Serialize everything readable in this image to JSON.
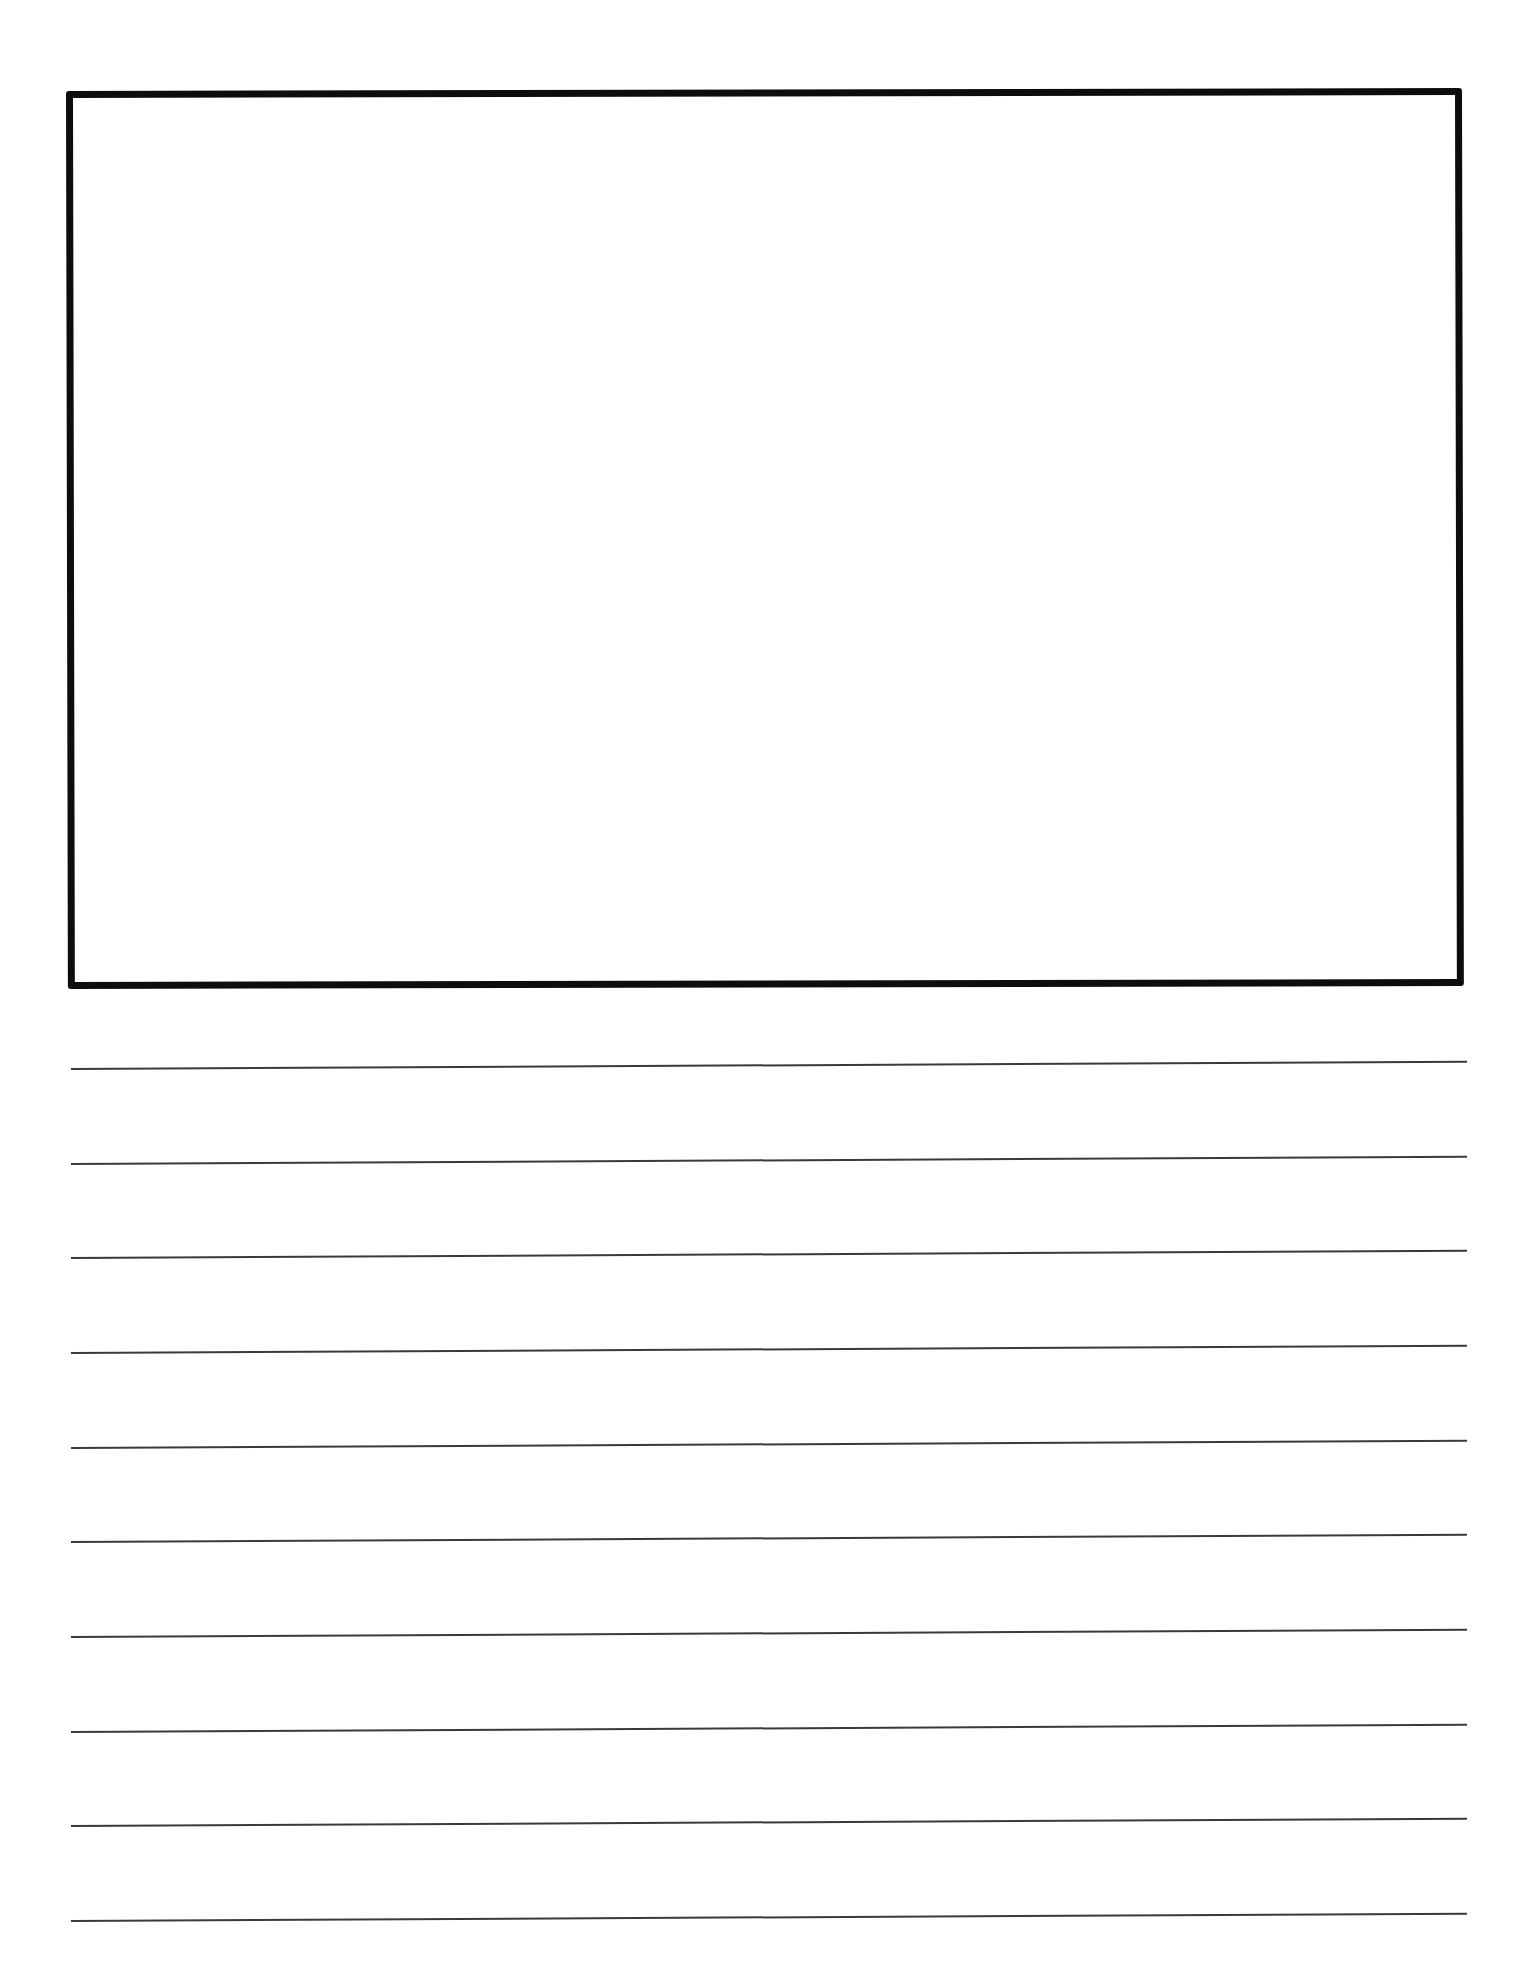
{
  "page": {
    "type": "primary writing paper",
    "background_color": "#ffffff"
  },
  "drawing_box": {
    "border_color": "#0d0d0d",
    "content": ""
  },
  "writing_lines": {
    "count": 10,
    "line_color": "#3a3a3a",
    "lines": [
      {
        "text": ""
      },
      {
        "text": ""
      },
      {
        "text": ""
      },
      {
        "text": ""
      },
      {
        "text": ""
      },
      {
        "text": ""
      },
      {
        "text": ""
      },
      {
        "text": ""
      },
      {
        "text": ""
      },
      {
        "text": ""
      }
    ]
  }
}
